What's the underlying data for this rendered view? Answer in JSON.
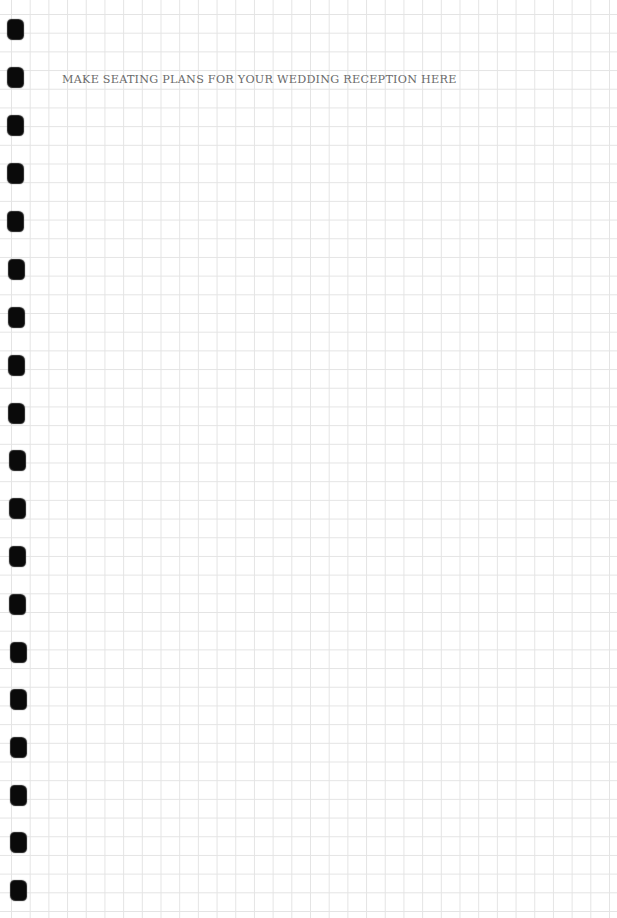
{
  "page": {
    "style": "grid-paper",
    "grid_color": "#e4e4e4",
    "background_color": "#ffffff",
    "hole_color": "#0a0a0a",
    "text_color": "#6a6a6a"
  },
  "heading": {
    "text": "MAKE SEATING PLANS FOR YOUR WEDDING RECEPTION HERE"
  },
  "binder_holes": [
    {
      "x": 8,
      "y": 20
    },
    {
      "x": 8,
      "y": 68
    },
    {
      "x": 8,
      "y": 116
    },
    {
      "x": 8,
      "y": 164
    },
    {
      "x": 8,
      "y": 212
    },
    {
      "x": 9,
      "y": 260
    },
    {
      "x": 9,
      "y": 308
    },
    {
      "x": 9,
      "y": 356
    },
    {
      "x": 9,
      "y": 404
    },
    {
      "x": 10,
      "y": 451
    },
    {
      "x": 10,
      "y": 499
    },
    {
      "x": 10,
      "y": 547
    },
    {
      "x": 10,
      "y": 595
    },
    {
      "x": 11,
      "y": 643
    },
    {
      "x": 11,
      "y": 690
    },
    {
      "x": 11,
      "y": 738
    },
    {
      "x": 11,
      "y": 786
    },
    {
      "x": 11,
      "y": 833
    },
    {
      "x": 11,
      "y": 881
    }
  ]
}
